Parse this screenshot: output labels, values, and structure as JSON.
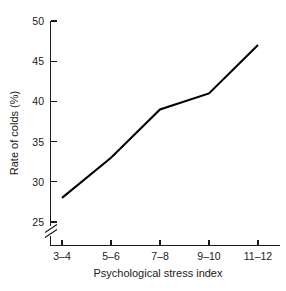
{
  "chart_data": {
    "type": "line",
    "title": "",
    "subtitle": "",
    "xlabel": "Psychological stress index",
    "ylabel": "Rate of colds (%)",
    "categories": [
      "3–4",
      "5–6",
      "7–8",
      "9–10",
      "11–12"
    ],
    "values": [
      28,
      33,
      39,
      41,
      47
    ],
    "series": [
      {
        "name": "Rate of colds",
        "values": [
          28,
          33,
          39,
          41,
          47
        ]
      }
    ],
    "yticks": [
      25,
      30,
      35,
      40,
      45,
      50
    ],
    "ytick_labels": [
      "25",
      "30",
      "35",
      "40",
      "45",
      "50"
    ],
    "ylim": [
      25,
      50
    ],
    "xlim": [
      0,
      4
    ],
    "grid": false,
    "legend": null,
    "y_axis_break": true,
    "annotations": [],
    "line_color": "#000000",
    "axis_color": "#1a1a1a",
    "background_color": "#ffffff"
  },
  "geometry": {
    "plot_left": 50,
    "plot_right": 280,
    "plot_top": 21,
    "plot_bottom": 245,
    "y_value_top": 50,
    "y_value_bottom": 25,
    "y_pixel_top": 21,
    "y_pixel_bottom": 222,
    "break_y_top": 226,
    "break_y_bottom": 236,
    "x_tick_pixels": [
      62,
      111,
      160,
      209,
      258
    ]
  },
  "labels": {
    "ytick_0": "25",
    "ytick_1": "30",
    "ytick_2": "35",
    "ytick_3": "40",
    "ytick_4": "45",
    "ytick_5": "50",
    "xtick_0": "3–4",
    "xtick_1": "5–6",
    "xtick_2": "7–8",
    "xtick_3": "9–10",
    "xtick_4": "11–12",
    "x_axis_title": "Psychological stress index",
    "y_axis_title": "Rate of colds (%)"
  }
}
